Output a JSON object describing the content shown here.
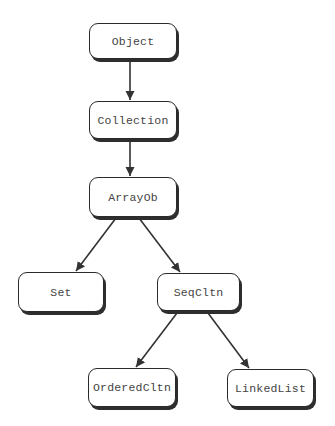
{
  "diagram": {
    "type": "class-hierarchy-tree",
    "colors": {
      "background": "#ffffff",
      "node_border": "#2a2a2a",
      "node_shadow": "#2e2e2e",
      "node_fill": "#ffffff",
      "text": "#444444",
      "edge": "#333333"
    },
    "nodes": [
      {
        "id": "object",
        "label": "Object",
        "x": 89,
        "y": 23,
        "w": 88,
        "h": 36
      },
      {
        "id": "collection",
        "label": "Collection",
        "x": 89,
        "y": 101,
        "w": 88,
        "h": 38
      },
      {
        "id": "arrayob",
        "label": "ArrayOb",
        "x": 89,
        "y": 177,
        "w": 88,
        "h": 40
      },
      {
        "id": "set",
        "label": "Set",
        "x": 18,
        "y": 272,
        "w": 86,
        "h": 40
      },
      {
        "id": "seqcltn",
        "label": "SeqCltn",
        "x": 157,
        "y": 273,
        "w": 83,
        "h": 38
      },
      {
        "id": "orderedcltn",
        "label": "OrderedCltn",
        "x": 88,
        "y": 368,
        "w": 88,
        "h": 39
      },
      {
        "id": "linkedlist",
        "label": "LinkedList",
        "x": 227,
        "y": 369,
        "w": 87,
        "h": 38
      }
    ],
    "edges": [
      {
        "from": "object",
        "to": "collection",
        "x1": 130,
        "y1": 60,
        "x2": 130,
        "y2": 100
      },
      {
        "from": "collection",
        "to": "arrayob",
        "x1": 130,
        "y1": 140,
        "x2": 130,
        "y2": 176
      },
      {
        "from": "arrayob",
        "to": "set",
        "x1": 116,
        "y1": 218,
        "x2": 76,
        "y2": 271
      },
      {
        "from": "arrayob",
        "to": "seqcltn",
        "x1": 139,
        "y1": 218,
        "x2": 180,
        "y2": 272
      },
      {
        "from": "seqcltn",
        "to": "orderedcltn",
        "x1": 177,
        "y1": 313,
        "x2": 136,
        "y2": 367
      },
      {
        "from": "seqcltn",
        "to": "linkedlist",
        "x1": 208,
        "y1": 313,
        "x2": 249,
        "y2": 368
      }
    ]
  }
}
